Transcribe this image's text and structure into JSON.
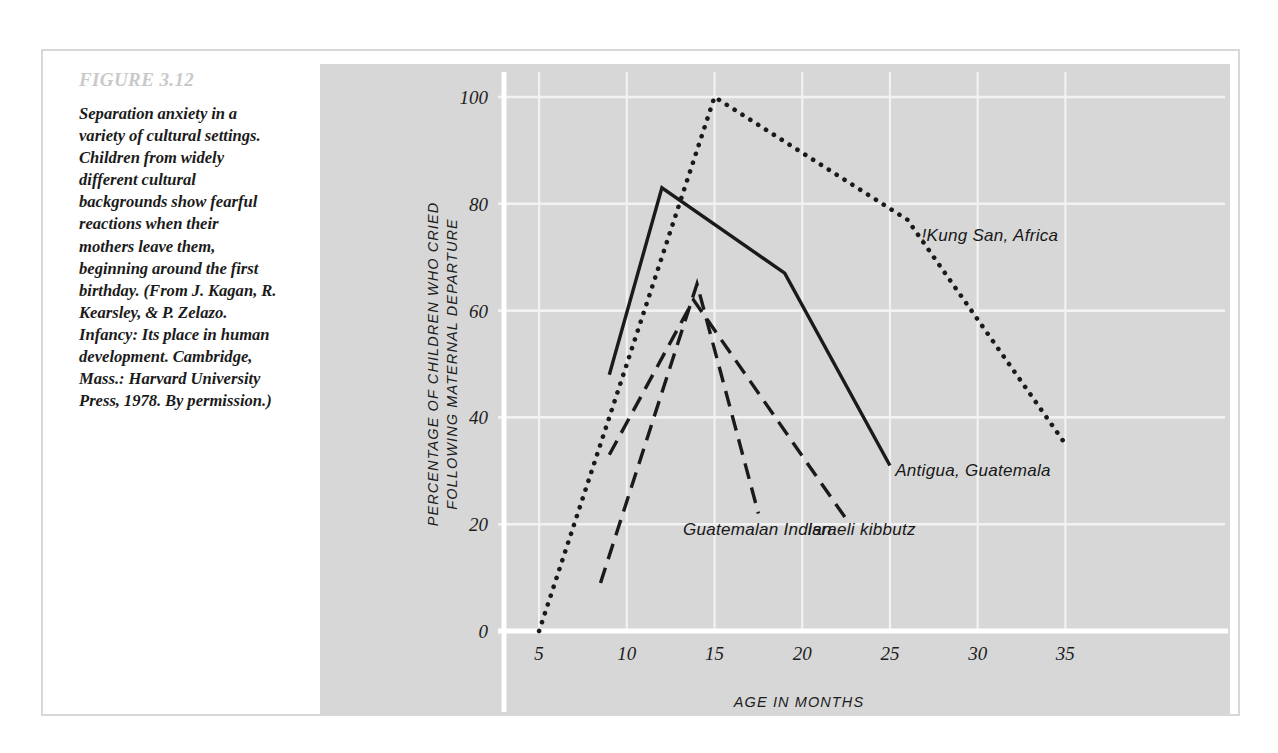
{
  "figure": {
    "number": "FIGURE 3.12",
    "caption": "Separation anxiety in a variety of cultural settings. Children from widely different cultural backgrounds show fearful reactions when their mothers leave them, beginning around the first birthday. (From J. Kagan, R. Kearsley, & P. Zelazo. Infancy: Its place in human development. Cambridge, Mass.: Harvard University Press, 1978. By permission.)"
  },
  "colors": {
    "panel_background": "#d7d7d7",
    "gridline": "#f2f2f2",
    "axis": "#ffffff",
    "ink": "#1a1a1a",
    "figure_number": "#c9c9c9",
    "card_border": "#d8d8d8"
  },
  "chart_data": {
    "type": "line",
    "title": "",
    "xlabel": "AGE IN MONTHS",
    "ylabel": "PERCENTAGE OF CHILDREN WHO CRIED FOLLOWING MATERNAL DEPARTURE",
    "ylabel_line1": "PERCENTAGE OF CHILDREN WHO CRIED",
    "ylabel_line2": "FOLLOWING MATERNAL DEPARTURE",
    "xlim": [
      3,
      38
    ],
    "ylim": [
      0,
      100
    ],
    "xticks": [
      5,
      10,
      15,
      20,
      25,
      30,
      35
    ],
    "yticks": [
      0,
      20,
      40,
      60,
      80,
      100
    ],
    "grid": true,
    "legend_position": "inline-labels",
    "series": [
      {
        "name": "!Kung San, Africa",
        "style": "dotted",
        "label_x": 26.8,
        "label_y": 73,
        "x": [
          5,
          15,
          26,
          35
        ],
        "y": [
          0,
          100,
          77,
          35
        ]
      },
      {
        "name": "Antigua, Guatemala",
        "style": "solid",
        "label_x": 25.3,
        "label_y": 29,
        "x": [
          9,
          12,
          19,
          25
        ],
        "y": [
          48,
          83,
          67,
          31
        ]
      },
      {
        "name": "Guatemalan Indian",
        "style": "dashed",
        "label_x": 13.2,
        "label_y": 18,
        "x": [
          8.5,
          14,
          17.5
        ],
        "y": [
          9,
          65,
          22
        ]
      },
      {
        "name": "Israeli kibbutz",
        "style": "dashed",
        "label_x": 20.3,
        "label_y": 18,
        "x": [
          9,
          13.8,
          22.5
        ],
        "y": [
          33,
          62,
          21
        ]
      }
    ]
  }
}
